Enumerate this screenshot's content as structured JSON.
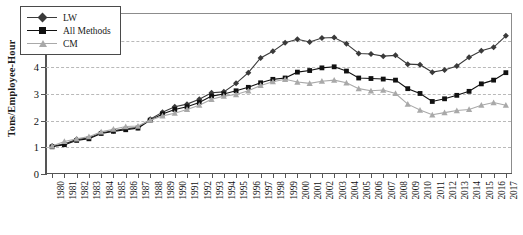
{
  "chart_data": {
    "type": "line",
    "title": "",
    "xlabel": "",
    "ylabel": "Tons/Employee-Hour",
    "ylim": [
      0,
      6
    ],
    "yticks": [
      0,
      1,
      2,
      3,
      4,
      5,
      6
    ],
    "grid": true,
    "legend_position": "top-left",
    "x": [
      1980,
      1981,
      1982,
      1983,
      1984,
      1985,
      1986,
      1987,
      1988,
      1989,
      1990,
      1991,
      1992,
      1993,
      1994,
      1995,
      1996,
      1997,
      1998,
      1999,
      2000,
      2001,
      2002,
      2003,
      2004,
      2005,
      2006,
      2007,
      2008,
      2009,
      2010,
      2011,
      2012,
      2013,
      2014,
      2015,
      2016,
      2017
    ],
    "categories": [
      "1980",
      "1981",
      "1982",
      "1983",
      "1984",
      "1985",
      "1986",
      "1987",
      "1988",
      "1989",
      "1990",
      "1991",
      "1992",
      "1993",
      "1994",
      "1995",
      "1996",
      "1997",
      "1998",
      "1999",
      "2000",
      "2001",
      "2002",
      "2003",
      "2004",
      "2005",
      "2006",
      "2007",
      "2008",
      "2009",
      "2010",
      "2011",
      "2012",
      "2013",
      "2014",
      "2015",
      "2016",
      "2017"
    ],
    "series": [
      {
        "name": "LW",
        "color": "#3a3a3a",
        "marker": "diamond",
        "values": [
          1.05,
          1.12,
          1.3,
          1.35,
          1.55,
          1.62,
          1.7,
          1.74,
          2.05,
          2.32,
          2.52,
          2.62,
          2.8,
          3.05,
          3.08,
          3.4,
          3.8,
          4.35,
          4.6,
          4.92,
          5.05,
          4.95,
          5.1,
          5.12,
          4.88,
          4.52,
          4.5,
          4.42,
          4.45,
          4.12,
          4.1,
          3.82,
          3.9,
          4.05,
          4.38,
          4.62,
          4.75,
          5.18
        ]
      },
      {
        "name": "All Methods",
        "color": "#111111",
        "marker": "square",
        "values": [
          1.02,
          1.1,
          1.26,
          1.32,
          1.52,
          1.6,
          1.66,
          1.72,
          2.02,
          2.25,
          2.42,
          2.52,
          2.68,
          2.92,
          3.0,
          3.12,
          3.25,
          3.42,
          3.55,
          3.6,
          3.82,
          3.88,
          3.98,
          4.02,
          3.86,
          3.6,
          3.58,
          3.56,
          3.52,
          3.2,
          3.02,
          2.72,
          2.82,
          2.95,
          3.1,
          3.38,
          3.52,
          3.8
        ]
      },
      {
        "name": "CM",
        "color": "#a9a9a9",
        "marker": "triangle",
        "values": [
          1.05,
          1.22,
          1.32,
          1.4,
          1.58,
          1.68,
          1.78,
          1.8,
          2.02,
          2.18,
          2.28,
          2.42,
          2.58,
          2.8,
          2.92,
          2.98,
          3.12,
          3.32,
          3.46,
          3.55,
          3.45,
          3.4,
          3.48,
          3.52,
          3.42,
          3.2,
          3.12,
          3.15,
          3.02,
          2.62,
          2.4,
          2.22,
          2.3,
          2.38,
          2.42,
          2.58,
          2.68,
          2.58
        ]
      }
    ]
  },
  "legend": {
    "items": [
      {
        "label": "LW"
      },
      {
        "label": "All Methods"
      },
      {
        "label": "CM"
      }
    ]
  },
  "axis": {
    "y_title": "Tons/Employee-Hour"
  }
}
